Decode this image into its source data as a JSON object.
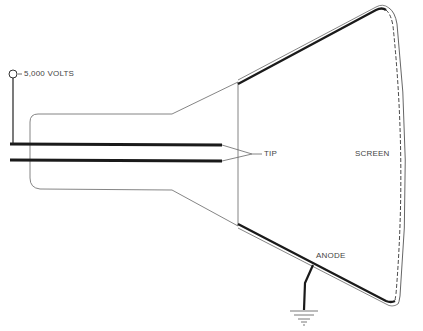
{
  "diagram": {
    "type": "cathode-ray-tube-schematic",
    "labels": {
      "voltage": "5,000 VOLTS",
      "tip": "TIP",
      "screen": "SCREEN",
      "anode": "ANODE"
    },
    "icons": {
      "terminal": "terminal-circle-icon",
      "ground": "ground-symbol-icon"
    },
    "colors": {
      "line": "#222222",
      "thin_line": "#555555",
      "label": "#444444",
      "background": "#ffffff"
    }
  }
}
